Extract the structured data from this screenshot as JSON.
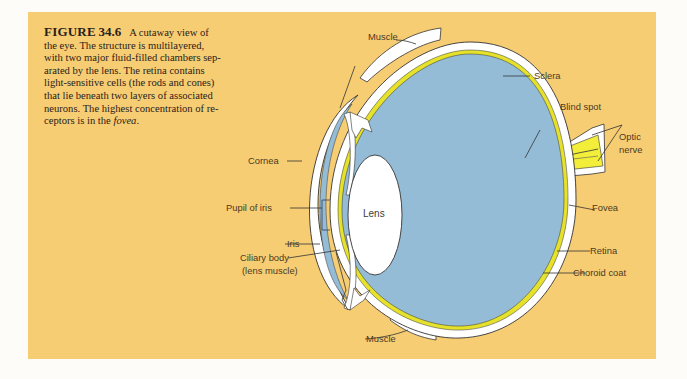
{
  "figure": {
    "label": "FIGURE",
    "number": "34.6",
    "caption_lines": [
      "A cutaway view of",
      "the eye. The structure is multilayered,",
      "with two major fluid-filled chambers sep-",
      "arated by the lens. The retina contains",
      "light-sensitive cells (the rods and cones)",
      "that lie beneath two layers of associated",
      "neurons. The highest concentration of re-",
      "ceptors is in the "
    ],
    "caption_emphasis": "fovea",
    "caption_end": "."
  },
  "labels": {
    "muscle_top": "Muscle",
    "sclera": "Sclera",
    "blind_spot": "Blind spot",
    "optic_nerve_1": "Optic",
    "optic_nerve_2": "nerve",
    "cornea": "Cornea",
    "pupil": "Pupil of iris",
    "lens": "Lens",
    "iris": "Iris",
    "ciliary_1": "Ciliary body",
    "ciliary_2": "(lens muscle)",
    "fovea": "Fovea",
    "retina": "Retina",
    "choroid": "Choroid coat",
    "muscle_bottom": "Muscle"
  },
  "colors": {
    "background_panel": "#f7cd74",
    "vitreous_blue": "#95bcd6",
    "sclera_white": "#ffffff",
    "retina_yellow": "#e6e12a",
    "optic_nerve_yellow": "#f3ee3a"
  }
}
